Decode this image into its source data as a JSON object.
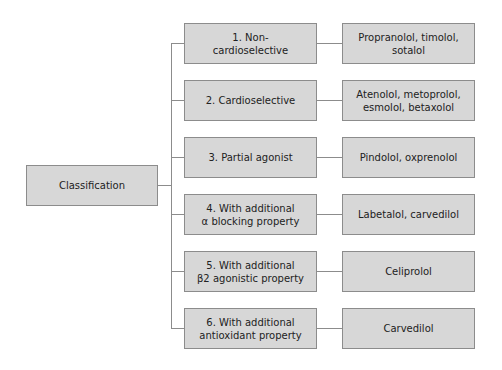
{
  "diagram": {
    "root": {
      "label": "Classification"
    },
    "categories": [
      {
        "label": "1. Non-\ncardioselective",
        "line1": "1. Non-",
        "line2": "cardioselective",
        "examples": "Propranolol, timolol, sotalol",
        "ex_line1": "Propranolol, timolol,",
        "ex_line2": "sotalol"
      },
      {
        "label": "2. Cardioselective",
        "line1": "2. Cardioselective",
        "line2": "",
        "examples": "Atenolol, metoprolol, esmolol, betaxolol",
        "ex_line1": "Atenolol, metoprolol,",
        "ex_line2": "esmolol, betaxolol"
      },
      {
        "label": "3. Partial agonist",
        "line1": "3. Partial agonist",
        "line2": "",
        "examples": "Pindolol, oxprenolol",
        "ex_line1": "Pindolol, oxprenolol",
        "ex_line2": ""
      },
      {
        "label": "4. With additional α blocking property",
        "line1": "4. With additional",
        "line2": "α blocking property",
        "examples": "Labetalol, carvedilol",
        "ex_line1": "Labetalol, carvedilol",
        "ex_line2": ""
      },
      {
        "label": "5. With additional β2 agonistic property",
        "line1": "5. With additional",
        "line2": "β2 agonistic property",
        "examples": "Celiprolol",
        "ex_line1": "Celiprolol",
        "ex_line2": ""
      },
      {
        "label": "6. With additional antioxidant property",
        "line1": "6. With additional",
        "line2": "antioxidant property",
        "examples": "Carvedilol",
        "ex_line1": "Carvedilol",
        "ex_line2": ""
      }
    ],
    "colors": {
      "box_fill": "#d7d7d7",
      "box_border": "#8c8c8c",
      "connector": "#8c8c8c",
      "text": "#222222"
    }
  }
}
